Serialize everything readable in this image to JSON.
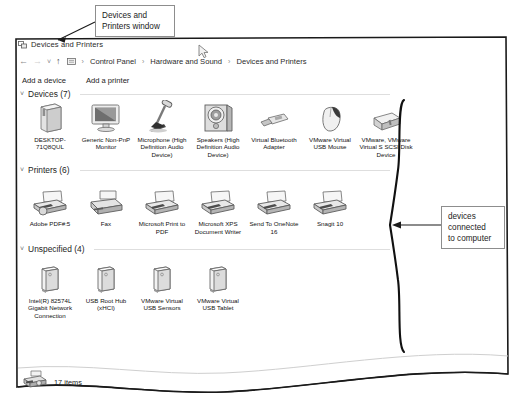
{
  "annotations": {
    "top_callout": "Devices and\nPrinters window",
    "top_callout_line1": "Devices and",
    "top_callout_line2": "Printers window",
    "right_callout_line1": "devices",
    "right_callout_line2": "connected",
    "right_callout_line3": "to computer"
  },
  "window": {
    "title": "Devices and Printers",
    "title_icon": "devices-printers-icon",
    "nav": {
      "back_icon": "back-arrow-icon",
      "forward_icon": "forward-arrow-icon",
      "recent_icon": "recent-pages-chevron-icon",
      "up_icon": "up-arrow-icon",
      "address_icon": "control-panel-icon",
      "breadcrumbs": [
        "Control Panel",
        "Hardware and Sound",
        "Devices and Printers"
      ],
      "separator": "›"
    },
    "toolbar": {
      "add_device_label": "Add a device",
      "add_printer_label": "Add a printer"
    },
    "groups": [
      {
        "id": "devices",
        "title": "Devices (7)",
        "chevron": "˅",
        "items": [
          {
            "label": "DESKTOP-71Q8QUL",
            "icon": "computer-tower-icon"
          },
          {
            "label": "Generic Non-PnP Monitor",
            "icon": "monitor-icon"
          },
          {
            "label": "Microphone (High Definition Audio Device)",
            "icon": "microphone-icon"
          },
          {
            "label": "Speakers (High Definition Audio Device)",
            "icon": "speaker-icon"
          },
          {
            "label": "Virtual Bluetooth Adapter",
            "icon": "usb-dongle-icon"
          },
          {
            "label": "VMware Virtual USB Mouse",
            "icon": "mouse-icon"
          },
          {
            "label": "VMware, VMware Virtual S SCSI Disk Device",
            "icon": "external-disk-icon"
          }
        ]
      },
      {
        "id": "printers",
        "title": "Printers (6)",
        "chevron": "˅",
        "items": [
          {
            "label": "Adobe PDF#:5",
            "icon": "printer-icon"
          },
          {
            "label": "Fax",
            "icon": "fax-icon"
          },
          {
            "label": "Microsoft Print to PDF",
            "icon": "printer-icon"
          },
          {
            "label": "Microsoft XPS Document Writer",
            "icon": "printer-icon"
          },
          {
            "label": "Send To OneNote 16",
            "icon": "printer-icon"
          },
          {
            "label": "Snagit 10",
            "icon": "printer-icon"
          }
        ]
      },
      {
        "id": "unspecified",
        "title": "Unspecified (4)",
        "chevron": "˅",
        "items": [
          {
            "label": "Intel(R) 82574L Gigabit Network Connection",
            "icon": "generic-device-icon"
          },
          {
            "label": "USB Root Hub (xHCI)",
            "icon": "generic-device-icon"
          },
          {
            "label": "VMware Virtual USB Sensors",
            "icon": "generic-device-icon"
          },
          {
            "label": "VMware Virtual USB Tablet",
            "icon": "generic-device-icon"
          }
        ]
      }
    ],
    "status": {
      "icon": "printer-small-icon",
      "text": "17 items"
    }
  },
  "colors": {
    "window_border": "#1a1a1a",
    "text": "#1b1b1b",
    "muted": "#8a8a8a",
    "rule": "#dedede"
  }
}
